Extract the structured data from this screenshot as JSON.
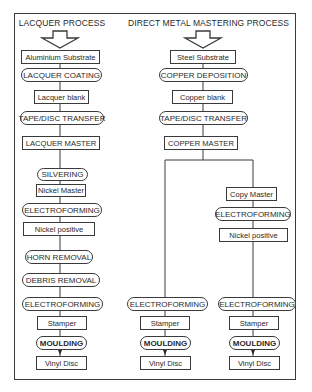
{
  "diagram": {
    "frame": {
      "border_color": "#3a3a3a"
    },
    "columns": [
      {
        "title": "LACQUER PROCESS",
        "steps": [
          {
            "label": "Aluminium Substrate",
            "type": "material"
          },
          {
            "label": "LACQUER COATING",
            "type": "process"
          },
          {
            "label": "Lacquer blank",
            "type": "material"
          },
          {
            "label": "TAPE/DISC TRANSFER",
            "type": "process"
          },
          {
            "label": "LACQUER MASTER",
            "type": "material"
          },
          {
            "label": "SILVERING",
            "type": "process"
          },
          {
            "label": "Nickel Master",
            "type": "material"
          },
          {
            "label": "ELECTROFORMING",
            "type": "process"
          },
          {
            "label": "Nickel positive",
            "type": "material"
          },
          {
            "label": "HORN REMOVAL",
            "type": "process"
          },
          {
            "label": "DEBRIS REMOVAL",
            "type": "process"
          },
          {
            "label": "ELECTROFORMING",
            "type": "process"
          },
          {
            "label": "Stamper",
            "type": "material"
          },
          {
            "label": "MOULDING",
            "type": "process"
          },
          {
            "label": "Vinyl Disc",
            "type": "material"
          }
        ]
      },
      {
        "title": "DIRECT METAL MASTERING PROCESS",
        "steps": [
          {
            "label": "Steel Substrate",
            "type": "material"
          },
          {
            "label": "COPPER DEPOSITION",
            "type": "process"
          },
          {
            "label": "Copper blank",
            "type": "material"
          },
          {
            "label": "TAPE/DISC TRANSFER",
            "type": "process"
          },
          {
            "label": "COPPER MASTER",
            "type": "material"
          }
        ],
        "branch_left": [
          {
            "label": "ELECTROFORMING",
            "type": "process"
          },
          {
            "label": "Stamper",
            "type": "material"
          },
          {
            "label": "MOULDING",
            "type": "process"
          },
          {
            "label": "Vinyl Disc",
            "type": "material"
          }
        ],
        "branch_right": [
          {
            "label": "Copy Master",
            "type": "material"
          },
          {
            "label": "ELECTROFORMING",
            "type": "process"
          },
          {
            "label": "Nickel positive",
            "type": "material"
          },
          {
            "label": "ELECTROFORMING",
            "type": "process"
          },
          {
            "label": "Stamper",
            "type": "material"
          },
          {
            "label": "MOULDING",
            "type": "process"
          },
          {
            "label": "Vinyl Disc",
            "type": "material"
          }
        ]
      }
    ]
  }
}
